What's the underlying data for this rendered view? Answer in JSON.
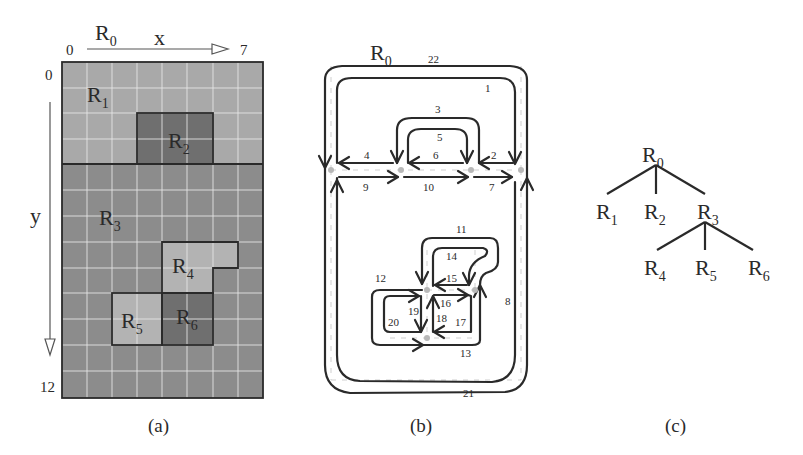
{
  "panels": {
    "a": {
      "caption": "(a)",
      "root_label": "R",
      "root_sub": "0",
      "x_axis": {
        "label": "x",
        "start": "0",
        "end": "7"
      },
      "y_axis": {
        "label": "y",
        "start": "0",
        "end": "12"
      },
      "grid": {
        "cols": 8,
        "rows": 13
      },
      "regions": [
        {
          "id": "R1",
          "label": "R",
          "sub": "1",
          "color": "#a9a9a9"
        },
        {
          "id": "R2",
          "label": "R",
          "sub": "2",
          "color": "#6f6f6f"
        },
        {
          "id": "R3",
          "label": "R",
          "sub": "3",
          "color": "#8c8c8c"
        },
        {
          "id": "R4",
          "label": "R",
          "sub": "4",
          "color": "#b3b3b3"
        },
        {
          "id": "R5",
          "label": "R",
          "sub": "5",
          "color": "#b3b3b3"
        },
        {
          "id": "R6",
          "label": "R",
          "sub": "6",
          "color": "#6f6f6f"
        }
      ]
    },
    "b": {
      "caption": "(b)",
      "root_label": "R",
      "root_sub": "0",
      "edge_labels": [
        "1",
        "2",
        "3",
        "4",
        "5",
        "6",
        "7",
        "8",
        "9",
        "10",
        "11",
        "12",
        "13",
        "14",
        "15",
        "16",
        "17",
        "18",
        "19",
        "20",
        "21",
        "22"
      ]
    },
    "c": {
      "caption": "(c)",
      "nodes": [
        {
          "id": "R0",
          "label": "R",
          "sub": "0"
        },
        {
          "id": "R1",
          "label": "R",
          "sub": "1"
        },
        {
          "id": "R2",
          "label": "R",
          "sub": "2"
        },
        {
          "id": "R3",
          "label": "R",
          "sub": "3"
        },
        {
          "id": "R4",
          "label": "R",
          "sub": "4"
        },
        {
          "id": "R5",
          "label": "R",
          "sub": "5"
        },
        {
          "id": "R6",
          "label": "R",
          "sub": "6"
        }
      ],
      "edges": [
        [
          "R0",
          "R1"
        ],
        [
          "R0",
          "R2"
        ],
        [
          "R0",
          "R3"
        ],
        [
          "R3",
          "R4"
        ],
        [
          "R3",
          "R5"
        ],
        [
          "R3",
          "R6"
        ]
      ]
    }
  }
}
